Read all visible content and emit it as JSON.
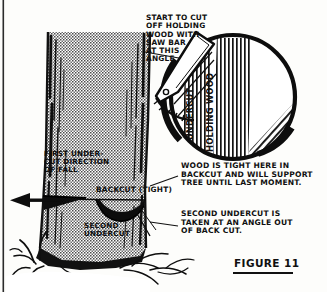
{
  "figure": {
    "title": "FIGURE 11",
    "background_color": "#fdfdfb",
    "ink_color": "#101010",
    "trunk_fill": "#b8b8b8"
  },
  "annotations": {
    "start_cut": "START TO CUT\nOFF HOLDING\nWOOD WITH\nSAW BAR\nAT THIS\nANGLE",
    "wood_tight": "WOOD IS TIGHT HERE IN\nBACKCUT AND WILL SUPPORT\nTREE UNTIL LAST MOMENT.",
    "second_undercut_note": "SECOND UNDERCUT IS\nTAKEN AT AN ANGLE OUT\nOF BACK CUT.",
    "first_undercut": "FIRST UNDER-\nCUT DIRECTION\nOF FALL",
    "backcut": "BACKCUT (TIGHT)",
    "second_undercut": "SECOND\nUNDERCUT"
  },
  "detail_circle": {
    "label_undercut": "UNDERCUT",
    "label_holding_wood": "HOLDING WOOD"
  },
  "icons": {
    "fall_direction": "left-arrow-icon",
    "saw_bar": "chainsaw-bar-icon",
    "tree": "tree-trunk-icon",
    "grass": "grass-tuft-icon"
  }
}
